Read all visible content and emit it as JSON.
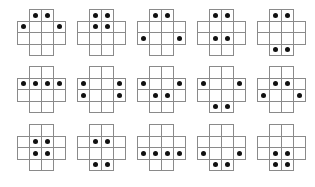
{
  "figure": {
    "line_color": "#8a8a8a",
    "dot_color": "#111111",
    "cell_layout": {
      "rows": [
        {
          "row": 0,
          "cols": [
            1,
            2
          ]
        },
        {
          "row": 1,
          "cols": [
            0,
            1,
            2,
            3
          ]
        },
        {
          "row": 2,
          "cols": [
            0,
            1,
            2,
            3
          ]
        },
        {
          "row": 3,
          "cols": [
            1,
            2
          ]
        }
      ]
    },
    "origins_x": [
      17,
      77,
      137,
      197,
      257
    ],
    "origins_y": [
      9,
      66,
      124
    ],
    "shapes": [
      {
        "id": "r1c1",
        "dots": [
          [
            0,
            1
          ],
          [
            0,
            2
          ],
          [
            1,
            0
          ],
          [
            1,
            3
          ]
        ]
      },
      {
        "id": "r1c2",
        "dots": [
          [
            0,
            1
          ],
          [
            0,
            2
          ],
          [
            1,
            1
          ],
          [
            1,
            2
          ]
        ]
      },
      {
        "id": "r1c3",
        "dots": [
          [
            0,
            1
          ],
          [
            0,
            2
          ],
          [
            2,
            0
          ],
          [
            2,
            3
          ]
        ]
      },
      {
        "id": "r1c4",
        "dots": [
          [
            0,
            1
          ],
          [
            0,
            2
          ],
          [
            2,
            1
          ],
          [
            2,
            2
          ]
        ]
      },
      {
        "id": "r1c5",
        "dots": [
          [
            0,
            1
          ],
          [
            0,
            2
          ],
          [
            3,
            1
          ],
          [
            3,
            2
          ]
        ]
      },
      {
        "id": "r2c1",
        "dots": [
          [
            1,
            0
          ],
          [
            1,
            1
          ],
          [
            1,
            2
          ],
          [
            1,
            3
          ]
        ]
      },
      {
        "id": "r2c2",
        "dots": [
          [
            1,
            0
          ],
          [
            1,
            3
          ],
          [
            2,
            0
          ],
          [
            2,
            3
          ]
        ]
      },
      {
        "id": "r2c3",
        "dots": [
          [
            1,
            0
          ],
          [
            1,
            3
          ],
          [
            2,
            1
          ],
          [
            2,
            2
          ]
        ]
      },
      {
        "id": "r2c4",
        "dots": [
          [
            1,
            0
          ],
          [
            1,
            3
          ],
          [
            3,
            1
          ],
          [
            3,
            2
          ]
        ]
      },
      {
        "id": "r2c5",
        "dots": [
          [
            1,
            1
          ],
          [
            1,
            2
          ],
          [
            2,
            0
          ],
          [
            2,
            3
          ]
        ]
      },
      {
        "id": "r3c1",
        "dots": [
          [
            1,
            1
          ],
          [
            1,
            2
          ],
          [
            2,
            1
          ],
          [
            2,
            2
          ]
        ]
      },
      {
        "id": "r3c2",
        "dots": [
          [
            1,
            1
          ],
          [
            1,
            2
          ],
          [
            3,
            1
          ],
          [
            3,
            2
          ]
        ]
      },
      {
        "id": "r3c3",
        "dots": [
          [
            2,
            0
          ],
          [
            2,
            1
          ],
          [
            2,
            2
          ],
          [
            2,
            3
          ]
        ]
      },
      {
        "id": "r3c4",
        "dots": [
          [
            2,
            0
          ],
          [
            2,
            3
          ],
          [
            3,
            1
          ],
          [
            3,
            2
          ]
        ]
      },
      {
        "id": "r3c5",
        "dots": [
          [
            2,
            1
          ],
          [
            2,
            2
          ],
          [
            3,
            1
          ],
          [
            3,
            2
          ]
        ]
      }
    ]
  }
}
